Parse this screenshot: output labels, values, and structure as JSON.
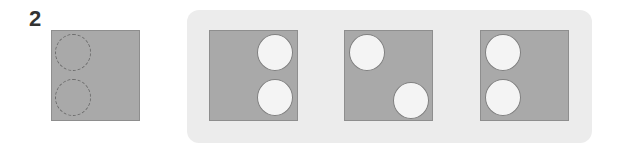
{
  "question": {
    "number": "2"
  },
  "colors": {
    "square": "#a9a9a9",
    "hole": "#f4f4f4",
    "panel": "#ececec"
  },
  "reference": {
    "label": "reference-square",
    "holes": [
      {
        "cx": 30,
        "cy": 22,
        "style": "dashed"
      },
      {
        "cx": 30,
        "cy": 67,
        "style": "dashed"
      }
    ]
  },
  "options": [
    {
      "label": "option-1",
      "holes": [
        {
          "cx": 66,
          "cy": 22
        },
        {
          "cx": 66,
          "cy": 67
        }
      ]
    },
    {
      "label": "option-2",
      "holes": [
        {
          "cx": 22,
          "cy": 22
        },
        {
          "cx": 66,
          "cy": 70
        }
      ]
    },
    {
      "label": "option-3",
      "holes": [
        {
          "cx": 22,
          "cy": 22
        },
        {
          "cx": 22,
          "cy": 67
        }
      ]
    }
  ]
}
